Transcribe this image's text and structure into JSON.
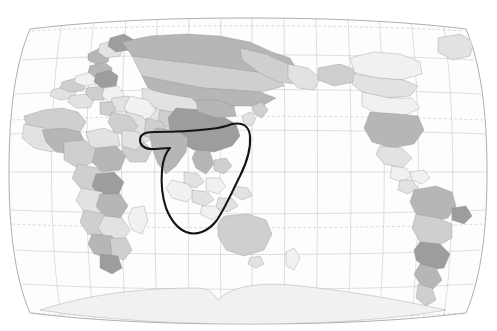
{
  "header": {
    "caption": "向亚洲出口的市场主要集中于东亚、东南亚及南亚地区"
  },
  "map": {
    "title": "世界地图",
    "projection": "Robinson",
    "center_longitude": 100,
    "frame_color": "#9a9a9a",
    "annotation": {
      "name": "highlight-region",
      "label": "南亚与东南亚圈注",
      "stroke_color": "#141414",
      "stroke_width": 2.1
    },
    "ocean_labels": [
      {
        "id": "pacific",
        "chars": [
          "太",
          "平",
          "洋"
        ],
        "x": [
          250,
          297,
          344
        ],
        "y": [
          160,
          160,
          160
        ]
      },
      {
        "id": "indian",
        "chars": [
          "印",
          "度",
          "洋"
        ],
        "x": [
          122,
          153,
          184
        ],
        "y": [
          207,
          207,
          207
        ]
      },
      {
        "id": "atlantic-w",
        "chars": [
          "大",
          "西",
          "洋"
        ],
        "x": [
          455,
          455,
          455
        ],
        "y": [
          68,
          158,
          253
        ]
      },
      {
        "id": "atlantic-e",
        "chars": [
          "大",
          "西",
          "洋"
        ],
        "x": [
          27,
          27,
          27
        ],
        "y": [
          70,
          118,
          226
        ]
      }
    ],
    "longitude_labels_top": [
      {
        "t": "20°",
        "x": 75
      },
      {
        "t": "北极圈",
        "x": 106
      },
      {
        "t": "40°",
        "x": 136
      },
      {
        "t": "60°",
        "x": 168
      },
      {
        "t": "80°",
        "x": 200
      },
      {
        "t": "100°",
        "x": 232
      },
      {
        "t": "120°",
        "x": 264
      },
      {
        "t": "140°",
        "x": 288
      },
      {
        "t": "北回归线",
        "x": 320
      },
      {
        "t": "160°",
        "x": 352
      },
      {
        "t": "180°",
        "x": 384
      },
      {
        "t": "160°",
        "x": 414
      },
      {
        "t": "140°",
        "x": 446
      }
    ],
    "longitude_labels_bottom": [
      {
        "t": "20°",
        "x": 88
      },
      {
        "t": "南极圈",
        "x": 117
      },
      {
        "t": "40°",
        "x": 146
      },
      {
        "t": "60°",
        "x": 176
      },
      {
        "t": "80°",
        "x": 205
      },
      {
        "t": "100°",
        "x": 234
      },
      {
        "t": "南回归线",
        "x": 262
      },
      {
        "t": "120°",
        "x": 291
      },
      {
        "t": "140°",
        "x": 320
      },
      {
        "t": "160°",
        "x": 349
      },
      {
        "t": "180°",
        "x": 378
      }
    ],
    "latitude_labels_right": [
      {
        "t": "北回归线",
        "y": 108
      },
      {
        "t": "赤道",
        "y": 158
      },
      {
        "t": "南回归线",
        "y": 210
      },
      {
        "t": "40°",
        "y": 238
      }
    ]
  }
}
